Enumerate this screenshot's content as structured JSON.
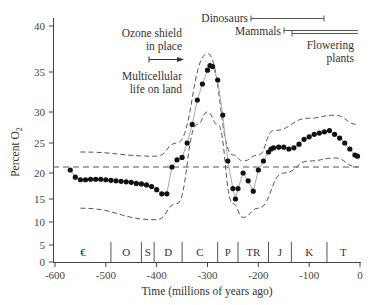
{
  "chart_data": {
    "type": "scatter",
    "title": "",
    "xlabel": "Time (millions of years ago)",
    "ylabel": "Percent O2",
    "xlim": [
      -600,
      0
    ],
    "ylim": [
      0,
      40
    ],
    "grid": false,
    "x_ticks": [
      -600,
      -500,
      -400,
      -300,
      -200,
      -100,
      0
    ],
    "y_ticks": [
      0,
      5,
      10,
      15,
      20,
      25,
      30,
      35,
      40
    ],
    "reference_line": {
      "name": "present-day O2 level",
      "y": 21,
      "style": "dashed"
    },
    "series": [
      {
        "name": "Estimated atmospheric O2",
        "x": [
          -570,
          -560,
          -550,
          -540,
          -530,
          -520,
          -510,
          -500,
          -490,
          -480,
          -470,
          -460,
          -450,
          -440,
          -430,
          -420,
          -410,
          -400,
          -390,
          -380,
          -370,
          -360,
          -350,
          -340,
          -330,
          -320,
          -310,
          -300,
          -295,
          -290,
          -280,
          -270,
          -260,
          -250,
          -245,
          -240,
          -230,
          -220,
          -210,
          -200,
          -190,
          -180,
          -175,
          -170,
          -160,
          -150,
          -140,
          -130,
          -120,
          -110,
          -100,
          -90,
          -80,
          -70,
          -60,
          -50,
          -40,
          -30,
          -20,
          -10,
          -5
        ],
        "y": [
          20.5,
          19.2,
          18.7,
          18.7,
          18.8,
          18.8,
          18.8,
          18.7,
          18.6,
          18.5,
          18.4,
          18.3,
          18.2,
          18.0,
          17.9,
          17.7,
          17.4,
          16.8,
          16.0,
          16.0,
          21.0,
          22.2,
          22.6,
          25.0,
          28.0,
          31.5,
          33.5,
          35.2,
          35.7,
          35.6,
          34.0,
          29.5,
          22.0,
          17.0,
          15.0,
          17.0,
          20.0,
          18.5,
          16.5,
          20.5,
          22.0,
          23.5,
          24.0,
          24.2,
          24.3,
          24.3,
          24.0,
          24.2,
          24.8,
          25.6,
          26.0,
          26.4,
          26.6,
          26.8,
          27.0,
          26.4,
          25.8,
          25.0,
          24.0,
          23.0,
          22.8
        ]
      }
    ],
    "uncertainty_band": {
      "upper": {
        "x": [
          -550,
          -400,
          -360,
          -300,
          -250,
          -230,
          -200,
          -170,
          -100,
          -50,
          -5
        ],
        "y": [
          23.5,
          22.8,
          25,
          37,
          23,
          22,
          23,
          27,
          29,
          29.5,
          28
        ]
      },
      "lower": {
        "x": [
          -550,
          -400,
          -360,
          -320,
          -300,
          -280,
          -250,
          -230,
          -200,
          -150,
          -100,
          -50,
          -5
        ],
        "y": [
          13,
          10.5,
          14,
          28,
          30,
          28,
          14,
          11,
          13,
          20,
          22,
          22.5,
          21
        ]
      }
    },
    "periods": [
      {
        "label": "€",
        "start": -600,
        "end": -490
      },
      {
        "label": "O",
        "start": -490,
        "end": -430
      },
      {
        "label": "S",
        "start": -430,
        "end": -405
      },
      {
        "label": "D",
        "start": -405,
        "end": -350
      },
      {
        "label": "C",
        "start": -350,
        "end": -280
      },
      {
        "label": "P",
        "start": -280,
        "end": -240
      },
      {
        "label": "TR",
        "start": -240,
        "end": -180
      },
      {
        "label": "J",
        "start": -180,
        "end": -135
      },
      {
        "label": "K",
        "start": -135,
        "end": -65
      },
      {
        "label": "T",
        "start": -65,
        "end": 0
      }
    ],
    "annotations": [
      {
        "text": "Ozone shield in place",
        "lines": [
          "Ozone shield",
          "in place"
        ],
        "arrow_x": [
          -450,
          -400
        ]
      },
      {
        "text": "Multicellular life on land",
        "lines": [
          "Multicellular",
          "life on land"
        ]
      },
      {
        "text": "Dinosaurs",
        "range": [
          -230,
          -65
        ]
      },
      {
        "text": "Mammals",
        "range": [
          -140,
          0
        ]
      },
      {
        "text": "Flowering plants",
        "lines": [
          "Flowering",
          "plants"
        ],
        "range": [
          -130,
          0
        ]
      }
    ]
  },
  "labels": {
    "ylabel_main": "Percent O",
    "ylabel_sub": "2",
    "xlabel": "Time (millions of years ago)",
    "ozone_line1": "Ozone shield",
    "ozone_line2": "in place",
    "multi_line1": "Multicellular",
    "multi_line2": "life on land",
    "dinosaurs": "Dinosaurs",
    "mammals": "Mammals",
    "flowering_line1": "Flowering",
    "flowering_line2": "plants"
  }
}
